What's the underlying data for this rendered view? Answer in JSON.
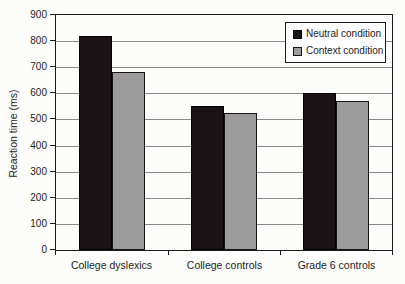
{
  "figure": {
    "background": "#fcfcfb"
  },
  "chart_data": {
    "type": "bar",
    "title": "",
    "categories": [
      "College dyslexics",
      "College controls",
      "Grade 6 controls"
    ],
    "series": [
      {
        "name": "Neutral condition",
        "values": [
          820,
          550,
          600
        ],
        "color": "#1a1215",
        "border_color": "#000000"
      },
      {
        "name": "Context condition",
        "values": [
          680,
          525,
          570
        ],
        "color": "#9b9b9b",
        "border_color": "#1a1215"
      }
    ],
    "xlabel": "",
    "ylabel": "Reaction time (ms)",
    "ylim": [
      0,
      900
    ],
    "yticks": [
      0,
      100,
      200,
      300,
      400,
      500,
      600,
      700,
      800,
      900
    ],
    "grid": true,
    "legend_position": "top-right-inside",
    "colors": {
      "gridline": "#8a8a8a",
      "axis": "#1a1a1a",
      "text": "#1c1c1c",
      "plot_background": "#fdfdfc"
    }
  }
}
